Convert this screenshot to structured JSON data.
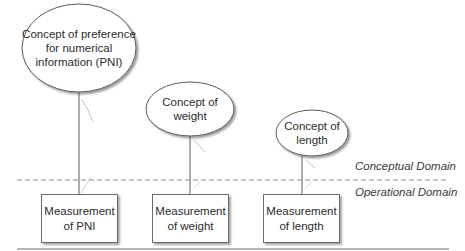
{
  "diagram": {
    "concepts": [
      {
        "id": "pni",
        "label": "Concept of preference for numerical information (PNI)",
        "lines": [
          "Concept of preference",
          "for numerical",
          "information (PNI)"
        ]
      },
      {
        "id": "weight",
        "label": "Concept of weight",
        "lines": [
          "Concept of",
          "weight"
        ]
      },
      {
        "id": "length",
        "label": "Concept of length",
        "lines": [
          "Concept of",
          "length"
        ]
      }
    ],
    "measurements": [
      {
        "id": "pni",
        "lines": [
          "Measurement",
          "of PNI"
        ]
      },
      {
        "id": "weight",
        "lines": [
          "Measurement",
          "of weight"
        ]
      },
      {
        "id": "length",
        "lines": [
          "Measurement",
          "of length"
        ]
      }
    ],
    "domains": {
      "conceptual": "Conceptual Domain",
      "operational": "Operational Domain"
    },
    "edges": [
      {
        "from": "concept:pni",
        "to": "measurement:pni"
      },
      {
        "from": "concept:weight",
        "to": "measurement:weight"
      },
      {
        "from": "concept:length",
        "to": "measurement:length"
      }
    ],
    "colors": {
      "stroke": "#6a6a6a",
      "text": "#2b2b2b",
      "dashed_divider": "#8a8a8a",
      "shadow": "#bdbdbd"
    }
  }
}
